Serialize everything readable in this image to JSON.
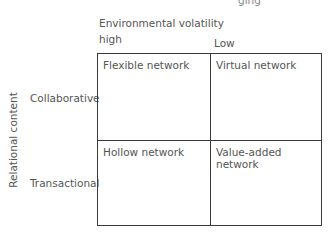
{
  "diagram": {
    "cropped_top_fragment": "ging",
    "x_axis": {
      "title": "Environmental volatility",
      "columns": [
        "high",
        "Low"
      ]
    },
    "y_axis": {
      "title": "Relational content",
      "rows": [
        "Collaborative",
        "Transactional"
      ]
    },
    "cells": [
      [
        "Flexible network",
        "Virtual network"
      ],
      [
        "Hollow network",
        "Value-added network"
      ]
    ]
  }
}
